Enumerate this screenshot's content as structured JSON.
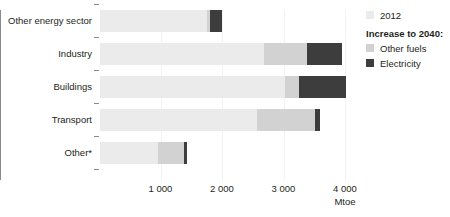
{
  "chart_data": {
    "type": "bar",
    "orientation": "horizontal",
    "stacked": true,
    "title": "",
    "subtitle": "",
    "xlabel": "Mtoe",
    "ylabel": "",
    "xlim": [
      0,
      4200
    ],
    "xticks": [
      1000,
      2000,
      3000,
      4000
    ],
    "xticklabels": [
      "1 000",
      "2 000",
      "3 000",
      "4 000"
    ],
    "grid": true,
    "legend_position": "right",
    "categories": [
      "Other energy sector",
      "Industry",
      "Buildings",
      "Transport",
      "Other*"
    ],
    "series": [
      {
        "name": "2012",
        "color": "#ebebeb",
        "values": [
          1740,
          2660,
          3010,
          2560,
          950
        ]
      },
      {
        "name": "Other fuels",
        "color": "#d2d2d2",
        "values": [
          50,
          710,
          230,
          930,
          410
        ]
      },
      {
        "name": "Electricity",
        "color": "#3d3d3d",
        "values": [
          190,
          570,
          760,
          90,
          60
        ]
      }
    ],
    "totals": [
      1980,
      3940,
      4000,
      3580,
      1420
    ]
  },
  "legend": {
    "first_label": "2012",
    "heading": "Increase to 2040:",
    "second_label": "Other fuels",
    "third_label": "Electricity"
  },
  "axis": {
    "unit": "Mtoe"
  },
  "colors": {
    "base_2012": "#ebebeb",
    "other_fuels": "#d2d2d2",
    "electricity": "#3d3d3d",
    "axis": "#8a8a8a",
    "grid": "#f2f2f2",
    "text": "#231f20"
  }
}
